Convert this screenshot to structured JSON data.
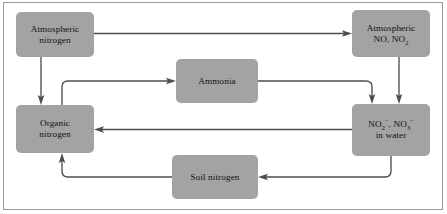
{
  "diagram": {
    "type": "flow-diagram",
    "background_color": "#ffffff",
    "node_color": "#a3a3a3",
    "arrow_color": "#4d4d4d",
    "border_color": "#9a9a9a",
    "nodes": [
      {
        "id": "atmospheric-nitrogen",
        "line1": "Atmospheric",
        "line2": "nitrogen"
      },
      {
        "id": "atmospheric-nox",
        "line1": "Atmospheric",
        "line2_pre": "NO, NO",
        "line2_sub": "2"
      },
      {
        "id": "ammonia",
        "line1": "Ammonia"
      },
      {
        "id": "organic-nitrogen",
        "line1": "Organic",
        "line2": "nitrogen"
      },
      {
        "id": "nitrite-nitrate-water",
        "line1_a": "NO",
        "line1_a_sub": "2",
        "line1_a_sup": "−",
        "line1_sep": ", ",
        "line1_b": "NO",
        "line1_b_sub": "3",
        "line1_b_sup": "−",
        "line2": "in water"
      },
      {
        "id": "soil-nitrogen",
        "line1": "Soil nitrogen"
      }
    ],
    "edges": [
      {
        "from": "atmospheric-nitrogen",
        "to": "atmospheric-nox",
        "route": "horizontal-top"
      },
      {
        "from": "atmospheric-nitrogen",
        "to": "organic-nitrogen",
        "route": "vertical-left"
      },
      {
        "from": "organic-nitrogen",
        "to": "ammonia",
        "route": "up-right-elbow"
      },
      {
        "from": "ammonia",
        "to": "nitrite-nitrate-water",
        "route": "right-down-elbow"
      },
      {
        "from": "atmospheric-nox",
        "to": "nitrite-nitrate-water",
        "route": "vertical-right"
      },
      {
        "from": "nitrite-nitrate-water",
        "to": "organic-nitrogen",
        "route": "horizontal-middle"
      },
      {
        "from": "nitrite-nitrate-water",
        "to": "soil-nitrogen",
        "route": "down-left-elbow"
      },
      {
        "from": "soil-nitrogen",
        "to": "organic-nitrogen",
        "route": "left-up-elbow"
      }
    ]
  }
}
